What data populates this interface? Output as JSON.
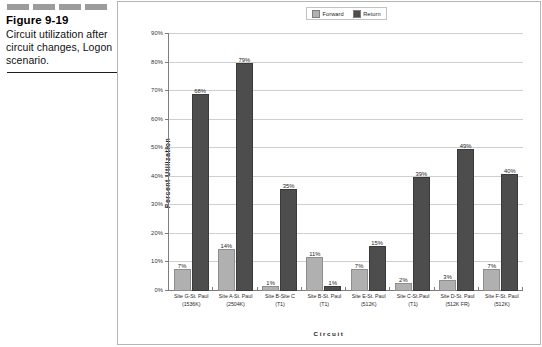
{
  "caption": {
    "figure_number": "Figure 9-19",
    "description": "Circuit utilization after circuit changes, Logon scenario."
  },
  "chart_data": {
    "type": "bar",
    "title": "",
    "xlabel": "Circuit",
    "ylabel": "Percent Utilization",
    "ylim": [
      0,
      90
    ],
    "ytick_labels": [
      "90%",
      "80%",
      "70%",
      "60%",
      "50%",
      "40%",
      "30%",
      "20%",
      "10%",
      "0%"
    ],
    "yticks": [
      90,
      80,
      70,
      60,
      50,
      40,
      30,
      20,
      10,
      0
    ],
    "grid": true,
    "legend_position": "top-center",
    "categories": [
      "Site G-St. Paul (1536K)",
      "Site A-St. Paul (2504K)",
      "Site B-Site C (T1)",
      "Site B-St. Paul (T1)",
      "Site E-St. Paul (512K)",
      "Site C-St.Paul (T1)",
      "Site D-St. Paul (512K FR)",
      "Site F-St. Paul (512K)"
    ],
    "category_lines": [
      [
        "Site G-St. Paul",
        "(1536K)"
      ],
      [
        "Site A-St. Paul",
        "(2504K)"
      ],
      [
        "Site B-Site C",
        "(T1)"
      ],
      [
        "Site B-St. Paul",
        "(T1)"
      ],
      [
        "Site E-St. Paul",
        "(512K)"
      ],
      [
        "Site C-St.Paul",
        "(T1)"
      ],
      [
        "Site D-St. Paul",
        "(512K FR)"
      ],
      [
        "Site F-St. Paul",
        "(512K)"
      ]
    ],
    "series": [
      {
        "name": "Forward",
        "color": "#b0b0b0",
        "values": [
          7,
          14,
          1,
          11,
          7,
          2,
          3,
          7
        ],
        "labels": [
          "7%",
          "14%",
          "1%",
          "11%",
          "7%",
          "2%",
          "3%",
          "7%"
        ]
      },
      {
        "name": "Return",
        "color": "#4d4d4d",
        "values": [
          68,
          79,
          35,
          1,
          15,
          39,
          49,
          40
        ],
        "labels": [
          "68%",
          "79%",
          "35%",
          "1%",
          "15%",
          "39%",
          "49%",
          "40%"
        ]
      }
    ]
  },
  "legend": {
    "items": [
      {
        "label": "Forward",
        "color": "#b0b0b0"
      },
      {
        "label": "Return",
        "color": "#4d4d4d"
      }
    ]
  }
}
